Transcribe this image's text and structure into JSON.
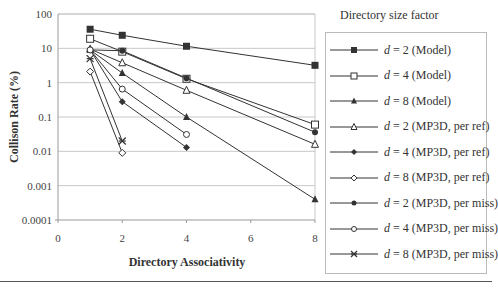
{
  "chart_data": {
    "type": "line",
    "title": "",
    "xlabel": "Directory Associativity",
    "ylabel": "Collison Rate (%)",
    "yscale": "log",
    "xlim": [
      0,
      8
    ],
    "ylim": [
      0.0001,
      100
    ],
    "xticks": [
      "0",
      "2",
      "4",
      "6",
      "8"
    ],
    "yticks": [
      "100",
      "10",
      "1",
      "0.1",
      "0.01",
      "0.001",
      "0.0001"
    ],
    "grid": "horizontal",
    "legend_title": "Directory size factor",
    "legend_position": "right",
    "series": [
      {
        "name": "d = 2 (Model)",
        "var": "d",
        "rest": " = 2 (Model)",
        "marker": "square-filled",
        "x": [
          1,
          2,
          4,
          8
        ],
        "y": [
          36,
          24,
          11.5,
          3.2
        ]
      },
      {
        "name": "d = 4 (Model)",
        "var": "d",
        "rest": " = 4 (Model)",
        "marker": "square-open",
        "x": [
          1,
          2,
          4,
          8
        ],
        "y": [
          19,
          8,
          1.3,
          0.06
        ]
      },
      {
        "name": "d = 8 (Model)",
        "var": "d",
        "rest": " = 8 (Model)",
        "marker": "triangle-filled",
        "x": [
          1,
          2,
          4,
          8
        ],
        "y": [
          9,
          1.9,
          0.1,
          0.0004
        ]
      },
      {
        "name": "d = 2 (MP3D, per ref)",
        "var": "d",
        "rest": " = 2 (MP3D, per ref)",
        "marker": "triangle-open",
        "x": [
          1,
          2,
          4,
          8
        ],
        "y": [
          9.5,
          3.8,
          0.6,
          0.016
        ]
      },
      {
        "name": "d = 4 (MP3D, per ref)",
        "var": "d",
        "rest": " = 4 (MP3D, per ref)",
        "marker": "diamond-filled",
        "x": [
          1,
          2,
          4
        ],
        "y": [
          9,
          0.28,
          0.013
        ]
      },
      {
        "name": "d = 8 (MP3D, per ref)",
        "var": "d",
        "rest": " = 8 (MP3D, per ref)",
        "marker": "diamond-open",
        "x": [
          1,
          2
        ],
        "y": [
          2.1,
          0.009
        ]
      },
      {
        "name": "d = 2 (MP3D, per miss)",
        "var": "d",
        "rest": " = 2 (MP3D, per miss)",
        "marker": "circle-filled",
        "x": [
          1,
          2,
          4,
          8
        ],
        "y": [
          9,
          8.5,
          1.35,
          0.036
        ]
      },
      {
        "name": "d = 4 (MP3D, per miss)",
        "var": "d",
        "rest": " = 4 (MP3D, per miss)",
        "marker": "circle-open",
        "x": [
          1,
          2,
          4
        ],
        "y": [
          9,
          0.65,
          0.031
        ]
      },
      {
        "name": "d = 8 (MP3D, per miss)",
        "var": "d",
        "rest": " = 8 (MP3D, per miss)",
        "marker": "star",
        "x": [
          1,
          2
        ],
        "y": [
          5,
          0.02
        ]
      }
    ]
  },
  "colors": {
    "line": "#333333",
    "grid": "#c8c8c8",
    "axis": "#999999"
  }
}
